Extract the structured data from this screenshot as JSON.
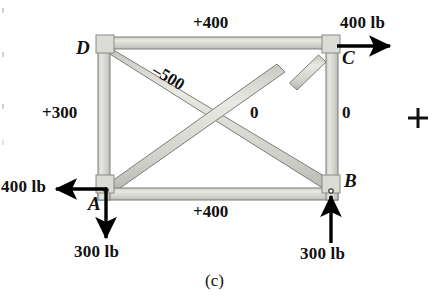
{
  "figure": {
    "caption": "(c)",
    "type": "truss-free-body-diagram",
    "background_color": "#ffffff",
    "member_fill": "#d9d9d4",
    "member_stroke": "#6f6f6f",
    "arrow_color": "#000000"
  },
  "joints": [
    {
      "id": "D",
      "label": "D",
      "x": 100,
      "y": 46
    },
    {
      "id": "C",
      "label": "C",
      "x": 333,
      "y": 46
    },
    {
      "id": "A",
      "label": "A",
      "x": 100,
      "y": 190
    },
    {
      "id": "B",
      "label": "B",
      "x": 333,
      "y": 190
    }
  ],
  "member_forces": {
    "top_chord_DC": "+400",
    "bottom_chord_AB": "+400",
    "left_chord_AD": "+300",
    "right_chord_BC": "0",
    "diagonal_DB": "–500",
    "diagonal_AC": "0"
  },
  "loads": [
    {
      "name": "load-at-C",
      "label": "400 lb",
      "direction": "right",
      "joint": "C"
    },
    {
      "name": "load-at-A",
      "label": "400 lb",
      "direction": "left",
      "joint": "A"
    },
    {
      "name": "load-at-A-vertical",
      "label": "300 lb",
      "direction": "down",
      "joint": "A"
    },
    {
      "name": "reaction-at-B",
      "label": "300 lb",
      "direction": "up",
      "joint": "B"
    }
  ],
  "registration_mark": "+"
}
